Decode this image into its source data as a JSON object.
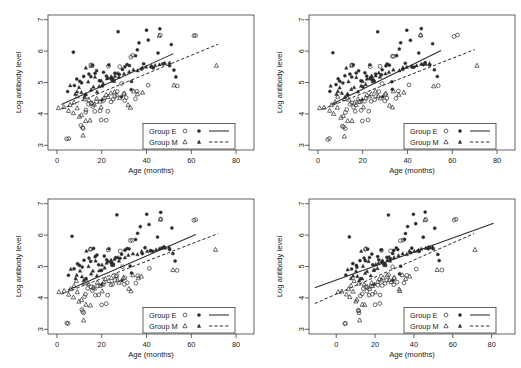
{
  "figure": {
    "background": "#ffffff",
    "marker_color": "#2b2b2b",
    "line_color": "#2b2b2b",
    "panel_count": 4
  },
  "chart_data": [
    {
      "type": "scatter",
      "panel": "top-left",
      "title": "",
      "xlabel": "Age (months)",
      "ylabel": "Log antibody level",
      "xlim": [
        -4,
        88
      ],
      "ylim": [
        2.85,
        7.15
      ],
      "xticks": [
        0,
        20,
        40,
        60,
        80
      ],
      "yticks": [
        3,
        4,
        5,
        6,
        7
      ],
      "grid": false,
      "legend_position": "bottom-right",
      "legend": [
        {
          "name": "Group E",
          "open_marker": "circle",
          "filled_marker": "circle",
          "line": "solid"
        },
        {
          "name": "Group M",
          "open_marker": "triangle",
          "filled_marker": "triangle",
          "line": "dashed"
        }
      ],
      "series": [
        {
          "name": "Group E open",
          "marker": "open-circle",
          "points": [
            [
              4.5,
              3.19
            ],
            [
              5.2,
              3.2
            ],
            [
              11,
              3.62
            ],
            [
              11.5,
              3.58
            ],
            [
              12,
              3.52
            ],
            [
              12.5,
              4.05
            ],
            [
              13,
              4.12
            ],
            [
              14,
              4.3
            ],
            [
              15,
              4.35
            ],
            [
              16,
              4.22
            ],
            [
              17,
              4.08
            ],
            [
              18,
              4.38
            ],
            [
              19,
              4.1
            ],
            [
              20,
              3.79
            ],
            [
              21,
              4.42
            ],
            [
              22,
              3.81
            ],
            [
              23,
              4.08
            ],
            [
              24,
              4.4
            ],
            [
              25,
              4.45
            ],
            [
              26,
              4.55
            ],
            [
              27,
              4.72
            ],
            [
              28,
              5.5
            ],
            [
              29,
              4.98
            ],
            [
              30,
              4.42
            ],
            [
              31,
              4.5
            ],
            [
              33,
              5.82
            ],
            [
              34,
              5.85
            ],
            [
              35,
              4.48
            ],
            [
              36,
              4.72
            ],
            [
              41,
              4.93
            ],
            [
              46,
              6.5
            ],
            [
              54,
              4.89
            ],
            [
              61,
              6.48
            ],
            [
              62,
              6.5
            ],
            [
              15,
              5.55
            ],
            [
              23,
              5.52
            ],
            [
              25,
              5.06
            ],
            [
              30,
              4.62
            ]
          ]
        },
        {
          "name": "Group E filled",
          "marker": "filled-circle",
          "points": [
            [
              5,
              4.72
            ],
            [
              7,
              5.96
            ],
            [
              8,
              4.92
            ],
            [
              9,
              5.1
            ],
            [
              10,
              5.05
            ],
            [
              11,
              4.98
            ],
            [
              12,
              5.2
            ],
            [
              13,
              4.62
            ],
            [
              14,
              5.28
            ],
            [
              15,
              5.18
            ],
            [
              16,
              5.56
            ],
            [
              17,
              5.3
            ],
            [
              18,
              5.38
            ],
            [
              19,
              5.05
            ],
            [
              20,
              4.88
            ],
            [
              21,
              5.32
            ],
            [
              22,
              5.22
            ],
            [
              23,
              5.55
            ],
            [
              24,
              5.12
            ],
            [
              25,
              5.06
            ],
            [
              26,
              5.28
            ],
            [
              27,
              6.63
            ],
            [
              28,
              5.25
            ],
            [
              29,
              5.4
            ],
            [
              30,
              5.52
            ],
            [
              31,
              5.58
            ],
            [
              32,
              5.55
            ],
            [
              33,
              5.02
            ],
            [
              35,
              5.85
            ],
            [
              36,
              6.05
            ],
            [
              37,
              6.28
            ],
            [
              38,
              5.42
            ],
            [
              39,
              5.6
            ],
            [
              40,
              6.65
            ],
            [
              41,
              6.35
            ],
            [
              42,
              5.5
            ],
            [
              43,
              5.48
            ],
            [
              45,
              5.95
            ],
            [
              46,
              6.72
            ],
            [
              47,
              5.58
            ],
            [
              48,
              5.62
            ],
            [
              50,
              5.55
            ],
            [
              51,
              6.22
            ],
            [
              52,
              5.4
            ],
            [
              53,
              5.18
            ],
            [
              29,
              4.55
            ],
            [
              33,
              4.78
            ]
          ]
        },
        {
          "name": "Group M open",
          "marker": "open-triangle",
          "points": [
            [
              1,
              4.18
            ],
            [
              3,
              4.22
            ],
            [
              5,
              4.1
            ],
            [
              6,
              4.3
            ],
            [
              7,
              4.02
            ],
            [
              8,
              4.38
            ],
            [
              9,
              4.2
            ],
            [
              10,
              3.9
            ],
            [
              11,
              3.95
            ],
            [
              12,
              3.3
            ],
            [
              13,
              3.78
            ],
            [
              14,
              4.45
            ],
            [
              15,
              3.78
            ],
            [
              16,
              4.35
            ],
            [
              17,
              4.3
            ],
            [
              18,
              4.48
            ],
            [
              19,
              4.4
            ],
            [
              20,
              4.2
            ],
            [
              21,
              4.52
            ],
            [
              22,
              4.6
            ],
            [
              23,
              4.55
            ],
            [
              24,
              4.65
            ],
            [
              25,
              5.05
            ],
            [
              26,
              4.72
            ],
            [
              27,
              4.58
            ],
            [
              28,
              4.5
            ],
            [
              30,
              4.65
            ],
            [
              32,
              4.28
            ],
            [
              33,
              4.22
            ],
            [
              34,
              4.72
            ],
            [
              36,
              4.62
            ],
            [
              38,
              4.68
            ],
            [
              46,
              6.5
            ],
            [
              52,
              4.9
            ],
            [
              71,
              5.55
            ],
            [
              15,
              5.55
            ],
            [
              12,
              4.48
            ],
            [
              9,
              4.55
            ]
          ]
        },
        {
          "name": "Group M filled",
          "marker": "filled-triangle",
          "points": [
            [
              6,
              4.9
            ],
            [
              8,
              4.62
            ],
            [
              9,
              4.72
            ],
            [
              10,
              4.85
            ],
            [
              11,
              4.68
            ],
            [
              12,
              4.55
            ],
            [
              13,
              4.62
            ],
            [
              14,
              5.02
            ],
            [
              15,
              4.78
            ],
            [
              16,
              4.85
            ],
            [
              17,
              5.18
            ],
            [
              18,
              4.72
            ],
            [
              19,
              4.88
            ],
            [
              20,
              5.05
            ],
            [
              21,
              4.95
            ],
            [
              22,
              5.12
            ],
            [
              23,
              5.15
            ],
            [
              24,
              5.2
            ],
            [
              25,
              5.08
            ],
            [
              26,
              5.22
            ],
            [
              27,
              5.3
            ],
            [
              28,
              5.18
            ],
            [
              30,
              5.28
            ],
            [
              32,
              5.35
            ],
            [
              34,
              5.42
            ],
            [
              36,
              5.38
            ],
            [
              38,
              5.48
            ],
            [
              40,
              5.5
            ],
            [
              42,
              5.52
            ],
            [
              44,
              5.55
            ],
            [
              46,
              5.58
            ],
            [
              48,
              5.6
            ],
            [
              50,
              5.62
            ],
            [
              24,
              5.18
            ],
            [
              20,
              4.45
            ],
            [
              13,
              5.48
            ]
          ]
        }
      ],
      "fits": [
        {
          "name": "Group E fit",
          "style": "solid",
          "x0": 2,
          "y0": 4.3,
          "x1": 52,
          "y1": 5.92
        },
        {
          "name": "Group M fit",
          "style": "dashed",
          "x0": 2,
          "y0": 4.16,
          "x1": 72,
          "y1": 6.22
        }
      ]
    },
    {
      "type": "scatter",
      "panel": "top-right",
      "title": "",
      "xlabel": "Age (months)",
      "ylabel": "Log antibody level",
      "xlim": [
        -4,
        88
      ],
      "ylim": [
        2.85,
        7.15
      ],
      "xticks": [
        0,
        20,
        40,
        60,
        80
      ],
      "yticks": [
        3,
        4,
        5,
        6,
        7
      ],
      "grid": false,
      "legend_position": "bottom-right",
      "legend": [
        {
          "name": "Group E",
          "open_marker": "circle",
          "filled_marker": "circle",
          "line": "solid"
        },
        {
          "name": "Group M",
          "open_marker": "triangle",
          "filled_marker": "triangle",
          "line": "dashed"
        }
      ],
      "fits": [
        {
          "name": "Group E fit",
          "style": "solid",
          "x0": 6,
          "y0": 4.3,
          "x1": 55,
          "y1": 6.02
        },
        {
          "name": "Group M fit",
          "style": "dashed",
          "x0": 2,
          "y0": 4.15,
          "x1": 70,
          "y1": 6.05
        }
      ]
    },
    {
      "type": "scatter",
      "panel": "bottom-left",
      "title": "",
      "xlabel": "Age (months)",
      "ylabel": "Log antibody level",
      "xlim": [
        -4,
        88
      ],
      "ylim": [
        2.85,
        7.15
      ],
      "xticks": [
        0,
        20,
        40,
        60,
        80
      ],
      "yticks": [
        3,
        4,
        5,
        6,
        7
      ],
      "grid": false,
      "legend_position": "bottom-right",
      "legend": [
        {
          "name": "Group E",
          "open_marker": "circle",
          "filled_marker": "circle",
          "line": "solid"
        },
        {
          "name": "Group M",
          "open_marker": "triangle",
          "filled_marker": "triangle",
          "line": "dashed"
        }
      ],
      "fits": [
        {
          "name": "Group E fit",
          "style": "solid",
          "x0": 5,
          "y0": 4.25,
          "x1": 62,
          "y1": 6.02
        },
        {
          "name": "Group M fit",
          "style": "dashed",
          "x0": 2,
          "y0": 4.12,
          "x1": 72,
          "y1": 6.05
        }
      ]
    },
    {
      "type": "scatter",
      "panel": "bottom-right",
      "title": "",
      "xlabel": "Age (months)",
      "ylabel": "Log antibody level",
      "xlim": [
        -14,
        92
      ],
      "ylim": [
        2.85,
        7.15
      ],
      "xticks": [
        0,
        20,
        40,
        60,
        80
      ],
      "yticks": [
        3,
        4,
        5,
        6,
        7
      ],
      "grid": false,
      "legend_position": "bottom-right",
      "legend": [
        {
          "name": "Group E",
          "open_marker": "circle",
          "filled_marker": "circle",
          "line": "solid"
        },
        {
          "name": "Group M",
          "open_marker": "triangle",
          "filled_marker": "triangle",
          "line": "dashed"
        }
      ],
      "fits": [
        {
          "name": "Group E fit",
          "style": "solid",
          "x0": -11,
          "y0": 4.32,
          "x1": 81,
          "y1": 6.38
        },
        {
          "name": "Group M fit",
          "style": "dashed",
          "x0": -11,
          "y0": 3.82,
          "x1": 71,
          "y1": 6.05
        }
      ]
    }
  ]
}
